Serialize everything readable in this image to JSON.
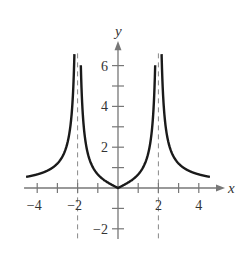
{
  "chart_data": {
    "type": "line",
    "title": "",
    "xlabel": "x",
    "ylabel": "y",
    "function": "y = |2x / (4 - x^2)|",
    "xlim": [
      -4.5,
      4.5
    ],
    "ylim": [
      -2,
      6.5
    ],
    "x_ticks": [
      -4,
      -3,
      -2,
      -1,
      1,
      2,
      3,
      4
    ],
    "x_tick_labels": [
      "-4",
      "-2",
      "2",
      "4"
    ],
    "x_tick_label_values": [
      -4,
      -2,
      2,
      4
    ],
    "y_ticks": [
      -2,
      -1,
      1,
      2,
      3,
      4,
      5,
      6
    ],
    "y_tick_labels": [
      "-2",
      "2",
      "4",
      "6"
    ],
    "y_tick_label_values": [
      -2,
      2,
      4,
      6
    ],
    "vertical_asymptotes": [
      -2,
      2
    ],
    "grid": false,
    "legend": null,
    "series": [
      {
        "name": "curve",
        "x": [
          -4.5,
          -4,
          -3.5,
          -3,
          -2.5,
          -2.2,
          -1.8,
          -1.5,
          -1,
          -0.5,
          0,
          0.5,
          1,
          1.5,
          1.8,
          2.2,
          2.5,
          3,
          3.5,
          4,
          4.5
        ],
        "values": [
          0.55,
          0.67,
          0.85,
          1.2,
          2.22,
          5.24,
          4.74,
          1.71,
          0.67,
          0.27,
          0,
          0.27,
          0.67,
          1.71,
          4.74,
          5.24,
          2.22,
          1.2,
          0.85,
          0.67,
          0.55
        ]
      }
    ]
  },
  "axes": {
    "x_name": "x",
    "y_name": "y"
  },
  "colors": {
    "curve": "#1a1a1a",
    "axis": "#777777",
    "asymptote": "#888888"
  }
}
